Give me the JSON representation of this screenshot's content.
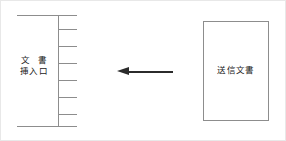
{
  "figure": {
    "width": 286,
    "height": 141,
    "background": "#ffffff",
    "border_color": "#e8e8e8",
    "line_color": "#8d8d8d",
    "arrow_color": "#2b2b2b",
    "text_color": "#1a1a1a"
  },
  "slot": {
    "name": "document-insertion-slot",
    "label_line1": "文 書",
    "label_line2": "挿入口",
    "tick_count": 6,
    "tick_offsets": [
      28,
      45,
      62,
      79,
      96,
      113
    ]
  },
  "arrow": {
    "direction": "left",
    "label": ""
  },
  "document": {
    "name": "outgoing-document",
    "label": "送信文書"
  }
}
